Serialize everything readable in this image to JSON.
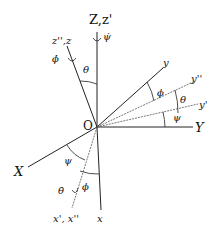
{
  "diagram": {
    "type": "euler-angles",
    "origin_label": "O",
    "axes": {
      "Z": "Z,z'",
      "z": "z'',z",
      "Y": "Y",
      "y": "y",
      "y2": "y''",
      "y1": "y'",
      "X": "X",
      "x1": "x', x''",
      "x": "x"
    },
    "angles": {
      "theta_top": "θ",
      "phi_y": "ϕ",
      "theta_y": "θ",
      "psi_y": "ψ",
      "psi_x": "ψ",
      "phi_x": "ϕ"
    },
    "rates": {
      "psi_dot": "ψ̇",
      "phi_dot": "ϕ̇",
      "theta_dot": "θ̇"
    }
  }
}
